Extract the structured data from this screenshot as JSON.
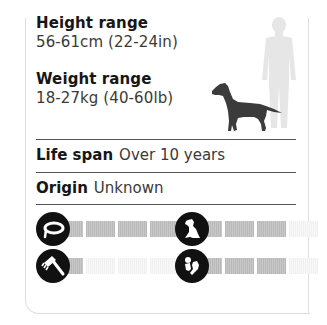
{
  "height": {
    "label": "Height range",
    "value": "56-61cm (22-24in)"
  },
  "weight": {
    "label": "Weight range",
    "value": "18-27kg (40-60lb)"
  },
  "life_span": {
    "label": "Life span",
    "value": "Over 10 years"
  },
  "origin": {
    "label": "Origin",
    "value": "Unknown"
  },
  "illustration": {
    "dog_icon": "dog-silhouette-icon",
    "human_icon": "human-silhouette-icon",
    "dog_color": "#3b3b3b",
    "human_color": "#e6e6e6"
  },
  "ratings": [
    {
      "name": "exercise",
      "icon": "collar-icon",
      "filled": 4,
      "total": 4
    },
    {
      "name": "grooming",
      "icon": "comb-icon",
      "filled": 1,
      "total": 4
    },
    {
      "name": "training",
      "icon": "sitting-dog-icon",
      "filled": 3,
      "total": 4
    },
    {
      "name": "family",
      "icon": "child-with-dog-icon",
      "filled": 3,
      "total": 4
    }
  ],
  "colors": {
    "rating_on": "#c0c0c0",
    "rating_off": "#f4f4f4",
    "icon_bg": "#111111"
  }
}
